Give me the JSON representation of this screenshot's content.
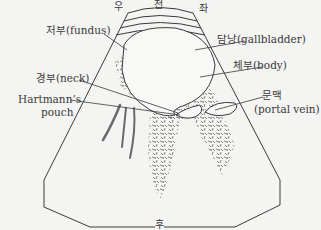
{
  "diagram": {
    "type": "ultrasound-schematic",
    "orientation_labels": {
      "top_left": "우",
      "top_center": "전",
      "top_right": "좌",
      "bottom": "후"
    },
    "labels": {
      "fundus": "저부(fundus)",
      "gallbladder": "담낭(gallbladder)",
      "body": "체부(body)",
      "neck": "경부(neck)",
      "hartmann_line1": "Hartmann’s",
      "hartmann_line2": "pouch",
      "portal_vein_line1": "문맥",
      "portal_vein_line2": "(portal vein)"
    },
    "colors": {
      "background": "#f4f4f2",
      "line": "#3a3a3a",
      "texture": "#555555",
      "shadow": "#6a6a6a"
    }
  }
}
